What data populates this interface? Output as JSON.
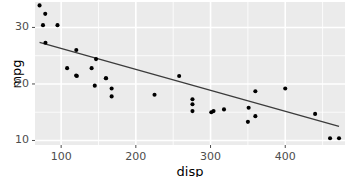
{
  "chart_data": {
    "type": "scatter",
    "title": "",
    "subtitle": "",
    "xlabel": "disp",
    "ylabel": "mpg",
    "xlim": [
      65,
      480
    ],
    "ylim": [
      9.2,
      34.5
    ],
    "xticks": [
      100,
      200,
      300,
      400
    ],
    "xticklabels": [
      "100",
      "200",
      "300",
      "400"
    ],
    "yticks": [
      10,
      20,
      30
    ],
    "yticklabels": [
      "10",
      "20",
      "30"
    ],
    "x_minor_ticks": [
      50,
      150,
      250,
      350,
      450
    ],
    "y_minor_ticks": [
      15,
      25
    ],
    "grid": true,
    "legend": "none",
    "point_color": "#000000",
    "point_size": 3.2,
    "panel_background": "#ebebeb",
    "grid_color": "#ffffff",
    "axis_text_color": "#4d4d4d",
    "axis_title_color": "#000000",
    "x": [
      160,
      160,
      108,
      258,
      360,
      225,
      360,
      146.7,
      140.8,
      167.6,
      167.6,
      275.8,
      275.8,
      275.8,
      472,
      460,
      440,
      78.7,
      75.7,
      71.1,
      120.1,
      318,
      304,
      350,
      400,
      79,
      120.3,
      95.1,
      351,
      145,
      301,
      121
    ],
    "y": [
      21,
      21,
      22.8,
      21.4,
      18.7,
      18.1,
      14.3,
      24.4,
      22.8,
      19.2,
      17.8,
      16.4,
      17.3,
      15.2,
      10.4,
      10.4,
      14.7,
      32.4,
      30.4,
      33.9,
      21.5,
      15.5,
      15.2,
      13.3,
      19.2,
      27.3,
      26,
      30.4,
      15.8,
      19.7,
      15,
      21.4
    ],
    "series": [
      {
        "name": "mtcars",
        "points": [
          [
            160,
            21
          ],
          [
            160,
            21
          ],
          [
            108,
            22.8
          ],
          [
            258,
            21.4
          ],
          [
            360,
            18.7
          ],
          [
            225,
            18.1
          ],
          [
            360,
            14.3
          ],
          [
            146.7,
            24.4
          ],
          [
            140.8,
            22.8
          ],
          [
            167.6,
            19.2
          ],
          [
            167.6,
            17.8
          ],
          [
            275.8,
            16.4
          ],
          [
            275.8,
            17.3
          ],
          [
            275.8,
            15.2
          ],
          [
            472,
            10.4
          ],
          [
            460,
            10.4
          ],
          [
            440,
            14.7
          ],
          [
            78.7,
            32.4
          ],
          [
            75.7,
            30.4
          ],
          [
            71.1,
            33.9
          ],
          [
            120.1,
            21.5
          ],
          [
            318,
            15.5
          ],
          [
            304,
            15.2
          ],
          [
            350,
            13.3
          ],
          [
            400,
            19.2
          ],
          [
            79,
            27.3
          ],
          [
            120.3,
            26
          ],
          [
            95.1,
            30.4
          ],
          [
            351,
            15.8
          ],
          [
            145,
            19.7
          ],
          [
            301,
            15
          ],
          [
            121,
            21.4
          ]
        ]
      }
    ],
    "trendline": {
      "type": "linear",
      "color": "#3b3b3b",
      "width": 1.3,
      "x_start": 71.1,
      "y_start": 27.35,
      "x_end": 472,
      "y_end": 12.5,
      "intercept": 29.6,
      "slope": -0.0412
    }
  }
}
